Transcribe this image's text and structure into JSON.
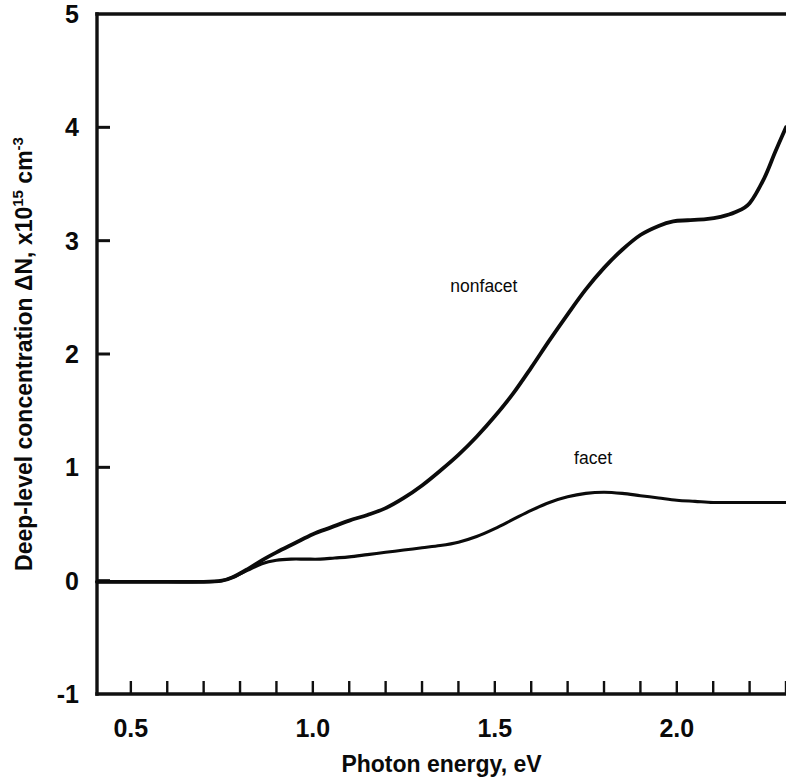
{
  "chart_data": {
    "type": "line",
    "title": "",
    "xlabel": "Photon energy,  eV",
    "ylabel_parts": {
      "main": "Deep-level concentration  ",
      "delta": "Δ",
      "n": "N,  x10",
      "exp1": "15",
      "unit": " cm",
      "exp2": "-3"
    },
    "ylabel": "Deep-level concentration  ΔN,  x10^15 cm^-3",
    "xlim": [
      0.407,
      2.3
    ],
    "ylim": [
      -1,
      5
    ],
    "grid": false,
    "legend_position": "inline-annotations",
    "xticks_major": [
      0.5,
      1.0,
      1.5,
      2.0
    ],
    "xticklabels": [
      "0.5",
      "1.0",
      "1.5",
      "2.0"
    ],
    "xticks_minor": [
      0.5,
      0.6,
      0.7,
      0.8,
      0.9,
      1.0,
      1.1,
      1.2,
      1.3,
      1.4,
      1.5,
      1.6,
      1.7,
      1.8,
      1.9,
      2.0,
      2.1,
      2.2,
      2.3
    ],
    "yticks_major": [
      -1,
      0,
      1,
      2,
      3,
      4,
      5
    ],
    "yticklabels": [
      "-1",
      "0",
      "1",
      "2",
      "3",
      "4",
      "5"
    ],
    "series": [
      {
        "name": "nonfacet",
        "label_x": 1.47,
        "label_y": 2.55,
        "x": [
          0.407,
          0.5,
          0.6,
          0.7,
          0.75,
          0.78,
          0.82,
          0.86,
          0.9,
          0.95,
          1.0,
          1.05,
          1.1,
          1.15,
          1.2,
          1.25,
          1.3,
          1.35,
          1.4,
          1.45,
          1.5,
          1.55,
          1.6,
          1.65,
          1.7,
          1.75,
          1.8,
          1.85,
          1.9,
          1.95,
          1.99,
          2.03,
          2.08,
          2.12,
          2.16,
          2.2,
          2.24,
          2.27,
          2.3
        ],
        "y": [
          -0.01,
          -0.01,
          -0.01,
          -0.01,
          0.0,
          0.03,
          0.1,
          0.18,
          0.25,
          0.33,
          0.41,
          0.47,
          0.53,
          0.58,
          0.64,
          0.73,
          0.84,
          0.97,
          1.11,
          1.27,
          1.45,
          1.65,
          1.88,
          2.12,
          2.35,
          2.57,
          2.76,
          2.92,
          3.05,
          3.13,
          3.17,
          3.18,
          3.19,
          3.21,
          3.25,
          3.33,
          3.55,
          3.78,
          4.0
        ]
      },
      {
        "name": "facet",
        "label_x": 1.77,
        "label_y": 1.03,
        "x": [
          0.407,
          0.5,
          0.6,
          0.7,
          0.75,
          0.78,
          0.82,
          0.86,
          0.9,
          0.94,
          0.98,
          1.02,
          1.06,
          1.1,
          1.15,
          1.2,
          1.25,
          1.3,
          1.35,
          1.4,
          1.45,
          1.5,
          1.55,
          1.6,
          1.65,
          1.7,
          1.75,
          1.8,
          1.85,
          1.9,
          1.95,
          2.0,
          2.05,
          2.1,
          2.15,
          2.2,
          2.25,
          2.3
        ],
        "y": [
          -0.01,
          -0.01,
          -0.01,
          -0.01,
          0.0,
          0.03,
          0.09,
          0.15,
          0.18,
          0.19,
          0.19,
          0.19,
          0.2,
          0.21,
          0.23,
          0.25,
          0.27,
          0.29,
          0.31,
          0.34,
          0.39,
          0.46,
          0.54,
          0.62,
          0.69,
          0.74,
          0.77,
          0.78,
          0.77,
          0.75,
          0.73,
          0.71,
          0.7,
          0.69,
          0.69,
          0.69,
          0.69,
          0.69
        ]
      }
    ]
  }
}
